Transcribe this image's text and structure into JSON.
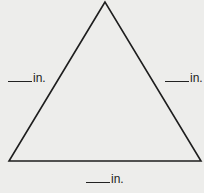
{
  "diagram": {
    "shape": "triangle",
    "stroke_color": "#1e1e1e",
    "background_color": "#ededeb",
    "vertices": {
      "apex": [
        105,
        2
      ],
      "bottom_left": [
        9,
        161
      ],
      "bottom_right": [
        201,
        161
      ]
    },
    "labels": {
      "left_side": {
        "blank": "____",
        "unit": "in."
      },
      "right_side": {
        "blank": "____",
        "unit": "in."
      },
      "bottom_side": {
        "blank": "____",
        "unit": "in."
      }
    }
  }
}
